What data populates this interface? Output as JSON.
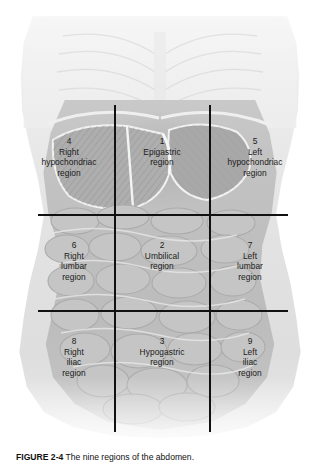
{
  "figure": {
    "alt_title": "The nine regions of the abdomen",
    "caption_number": "FIGURE 2-4",
    "caption_text": "The nine regions of the abdomen.",
    "line_color": "#111111",
    "background_color": "#ffffff",
    "organ_tint": "#c2c2c2"
  },
  "grid": {
    "vertical_lines": [
      115,
      210
    ],
    "horizontal_lines": [
      215,
      311
    ],
    "vertical_top": 105,
    "vertical_bottom": 432,
    "horizontal_left": 38,
    "horizontal_right": 288
  },
  "regions": [
    {
      "number": "4",
      "name": "Right\nhypochondriac\nregion",
      "line1": "Right",
      "line2": "hypochondriac",
      "line3": "region",
      "row": "upper",
      "column": "right"
    },
    {
      "number": "1",
      "name": "Epigastric\nregion",
      "line1": "Epigastric",
      "line2": "region",
      "line3": "",
      "row": "upper",
      "column": "center"
    },
    {
      "number": "5",
      "name": "Left\nhypochondriac\nregion",
      "line1": "Left",
      "line2": "hypochondriac",
      "line3": "region",
      "row": "upper",
      "column": "left"
    },
    {
      "number": "6",
      "name": "Right\nlumbar\nregion",
      "line1": "Right",
      "line2": "lumbar",
      "line3": "region",
      "row": "middle",
      "column": "right"
    },
    {
      "number": "2",
      "name": "Umbilical\nregion",
      "line1": "Umbilical",
      "line2": "region",
      "line3": "",
      "row": "middle",
      "column": "center"
    },
    {
      "number": "7",
      "name": "Left\nlumbar\nregion",
      "line1": "Left",
      "line2": "lumbar",
      "line3": "region",
      "row": "middle",
      "column": "left"
    },
    {
      "number": "8",
      "name": "Right\niliac\nregion",
      "line1": "Right",
      "line2": "iliac",
      "line3": "region",
      "row": "lower",
      "column": "right"
    },
    {
      "number": "3",
      "name": "Hypogastric\nregion",
      "line1": "Hypogastric",
      "line2": "region",
      "line3": "",
      "row": "lower",
      "column": "center"
    },
    {
      "number": "9",
      "name": "Left\niliac\nregion",
      "line1": "Left",
      "line2": "iliac",
      "line3": "region",
      "row": "lower",
      "column": "left"
    }
  ]
}
